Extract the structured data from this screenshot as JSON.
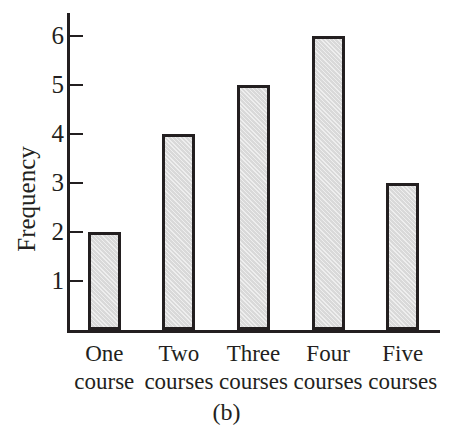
{
  "chart_data": {
    "type": "bar",
    "title": "",
    "subtitle": "",
    "xlabel": "",
    "ylabel": "Frequency",
    "categories": [
      "One course",
      "Two courses",
      "Three courses",
      "Four courses",
      "Five courses"
    ],
    "category_lines": [
      [
        "One",
        "course"
      ],
      [
        "Two",
        "courses"
      ],
      [
        "Three",
        "courses"
      ],
      [
        "Four",
        "courses"
      ],
      [
        "Five",
        "courses"
      ]
    ],
    "values": [
      2,
      4,
      5,
      6,
      3
    ],
    "ylim": [
      0,
      6.5
    ],
    "yticks": [
      1,
      2,
      3,
      4,
      5,
      6
    ],
    "ytick_labels": [
      "1",
      "2",
      "3",
      "4",
      "5",
      "6"
    ],
    "grid": false,
    "legend": false,
    "bar_fill_color": "#d9d9d9",
    "bar_edge_color": "#231f20",
    "axis_color": "#231f20",
    "background_color": "#ffffff"
  },
  "caption": {
    "text": "(b)"
  }
}
